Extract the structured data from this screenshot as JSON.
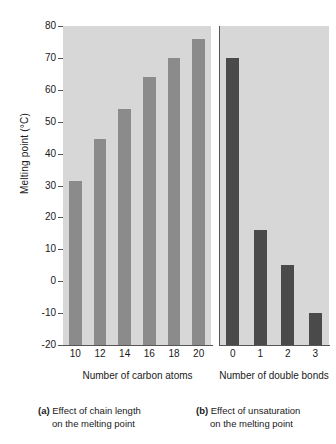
{
  "chart_data": [
    {
      "type": "bar",
      "panel": "a",
      "title": "",
      "xlabel": "Number of carbon atoms",
      "ylabel": "Melting point (°C)",
      "categories": [
        "10",
        "12",
        "14",
        "16",
        "18",
        "20"
      ],
      "values": [
        31.5,
        44.5,
        54,
        64,
        70,
        76
      ],
      "ylim": [
        -20,
        80
      ],
      "yticks": [
        "80",
        "70",
        "60",
        "50",
        "40",
        "30",
        "20",
        "10",
        "0",
        "-10",
        "-20"
      ],
      "ytick_values": [
        80,
        70,
        60,
        50,
        40,
        30,
        20,
        10,
        0,
        -10,
        -20
      ],
      "grid": false,
      "legend": "none",
      "bar_color": "#8b8b8b",
      "plot_bg": "#d7d7d7"
    },
    {
      "type": "bar",
      "panel": "b",
      "title": "",
      "xlabel_line1": "Number of",
      "xlabel_line2": "double bonds",
      "ylabel": "Melting point (°C)",
      "categories": [
        "0",
        "1",
        "2",
        "3"
      ],
      "values": [
        70,
        16,
        5,
        -10
      ],
      "ylim": [
        -20,
        80
      ],
      "grid": false,
      "legend": "none",
      "bar_color": "#4a4a4a",
      "plot_bg": "#d7d7d7"
    }
  ],
  "axis": {
    "ylabel": "Melting point (°C)",
    "yticks": [
      "80",
      "70",
      "60",
      "50",
      "40",
      "30",
      "20",
      "10",
      "0",
      "-10",
      "-20"
    ],
    "xticks_a": [
      "10",
      "12",
      "14",
      "16",
      "18",
      "20"
    ],
    "xticks_b": [
      "0",
      "1",
      "2",
      "3"
    ],
    "xtitle_a": "Number of carbon atoms",
    "xtitle_b_line1": "Number of",
    "xtitle_b_line2": "double bonds"
  },
  "captions": {
    "a": {
      "tag": "(a)",
      "line1": "Effect of chain length",
      "line2": "on the melting point"
    },
    "b": {
      "tag": "(b)",
      "line1": "Effect of unsaturation",
      "line2": "on the melting point"
    }
  },
  "colors": {
    "bar_a": "#8b8b8b",
    "bar_b": "#4a4a4a",
    "panel_bg": "#d7d7d7",
    "axis": "#555555",
    "text": "#1a1a1a",
    "page_bg": "#ffffff"
  }
}
